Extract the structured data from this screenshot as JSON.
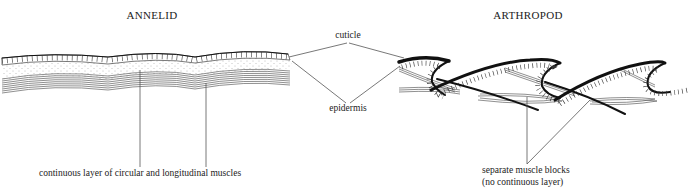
{
  "diagram": {
    "panels": [
      {
        "id": "annelid",
        "title": "ANNELID",
        "layers": [
          "cuticle",
          "epidermis",
          "connective tissue (stippled)",
          "circular and longitudinal muscle layer"
        ],
        "muscle_label": "continuous layer of circular and longitudinal muscles"
      },
      {
        "id": "arthropod",
        "title": "ARTHROPOD",
        "layers": [
          "thickened sclerotized cuticle plates",
          "epidermis",
          "separate muscle blocks"
        ],
        "muscle_label_line1": "separate muscle blocks",
        "muscle_label_line2": "(no continuous layer)"
      }
    ],
    "shared_labels": {
      "cuticle": "cuticle",
      "epidermis": "epidermis"
    },
    "colors": {
      "ink": "#111111",
      "background": "#ffffff",
      "leader": "#555555"
    }
  }
}
